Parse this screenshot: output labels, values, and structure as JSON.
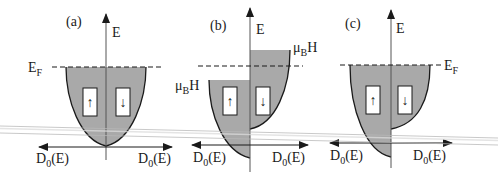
{
  "colors": {
    "fill": "#a9a9a9",
    "stroke": "#1a1a1a",
    "axis": "#555555",
    "artifact": "#c8c8c8"
  },
  "panels": [
    {
      "id": "a",
      "label": "(a)",
      "axis_label": "E",
      "fermi_label": "E",
      "fermi_sub": "F",
      "dos_left": "D",
      "dos_left_sub": "0",
      "dos_left_tail": "(E)",
      "dos_right": "D",
      "dos_right_sub": "0",
      "dos_right_tail": "(E)",
      "spin_up": "↑",
      "spin_down": "↓"
    },
    {
      "id": "b",
      "label": "(b)",
      "axis_label": "E",
      "zeeman_left": "μ",
      "zeeman_left_sub": "B",
      "zeeman_left_tail": "H",
      "zeeman_right": "μ",
      "zeeman_right_sub": "B",
      "zeeman_right_tail": "H",
      "dos_left": "D",
      "dos_left_sub": "0",
      "dos_left_tail": "(E)",
      "dos_right": "D",
      "dos_right_sub": "0",
      "dos_right_tail": "(E)",
      "spin_up": "↑",
      "spin_down": "↓"
    },
    {
      "id": "c",
      "label": "(c)",
      "axis_label": "E",
      "fermi_label": "E",
      "fermi_sub": "F",
      "dos_left": "D",
      "dos_left_sub": "0",
      "dos_left_tail": "(E)",
      "dos_right": "D",
      "dos_right_sub": "0",
      "dos_right_tail": "(E)",
      "spin_up": "↑",
      "spin_down": "↓"
    }
  ]
}
